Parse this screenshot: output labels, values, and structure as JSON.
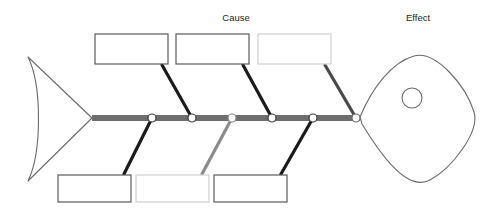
{
  "diagram": {
    "type": "fishbone-ishikawa",
    "title_labels": {
      "cause": "Cause",
      "effect": "Effect"
    },
    "colors": {
      "spine": "#6e6e6e",
      "bone_dark": "#1a1a1a",
      "bone_gray": "#8c8c8c",
      "box_border_dark": "#5a5a5a",
      "box_border_light": "#cfcfcf",
      "outline": "#6a6a6a",
      "joint_fill": "#ffffff",
      "text": "#231f20",
      "background": "#ffffff"
    },
    "spine": {
      "x_start": 92,
      "x_end": 360,
      "y": 118,
      "thickness": 6
    },
    "joints": [
      {
        "id": "joint-1",
        "x": 152,
        "y": 118,
        "r": 4
      },
      {
        "id": "joint-2",
        "x": 192,
        "y": 118,
        "r": 4
      },
      {
        "id": "joint-3",
        "x": 232,
        "y": 118,
        "r": 4
      },
      {
        "id": "joint-4",
        "x": 272,
        "y": 118,
        "r": 4
      },
      {
        "id": "joint-5",
        "x": 313,
        "y": 118,
        "r": 4
      },
      {
        "id": "joint-6",
        "x": 356,
        "y": 118,
        "r": 4
      }
    ],
    "top_boxes": [
      {
        "id": "top-box-1",
        "label": "",
        "x": 95,
        "y": 34,
        "w": 73,
        "h": 30,
        "border": "dark"
      },
      {
        "id": "top-box-2",
        "label": "",
        "x": 176,
        "y": 34,
        "w": 73,
        "h": 30,
        "border": "dark"
      },
      {
        "id": "top-box-3",
        "label": "",
        "x": 258,
        "y": 34,
        "w": 73,
        "h": 30,
        "border": "light"
      }
    ],
    "bottom_boxes": [
      {
        "id": "bottom-box-1",
        "label": "",
        "x": 58,
        "y": 175,
        "w": 73,
        "h": 27,
        "border": "dark"
      },
      {
        "id": "bottom-box-2",
        "label": "",
        "x": 136,
        "y": 175,
        "w": 73,
        "h": 27,
        "border": "light"
      },
      {
        "id": "bottom-box-3",
        "label": "",
        "x": 214,
        "y": 175,
        "w": 73,
        "h": 27,
        "border": "dark"
      }
    ],
    "top_bones": [
      {
        "id": "top-bone-1",
        "x1": 162,
        "y1": 65,
        "x2": 192,
        "y2": 118,
        "color": "dark"
      },
      {
        "id": "top-bone-2",
        "x1": 243,
        "y1": 65,
        "x2": 272,
        "y2": 118,
        "color": "dark"
      },
      {
        "id": "top-bone-3",
        "x1": 325,
        "y1": 65,
        "x2": 356,
        "y2": 118,
        "color": "dark"
      }
    ],
    "bottom_bones": [
      {
        "id": "bottom-bone-1",
        "x1": 124,
        "y1": 174,
        "x2": 152,
        "y2": 118,
        "color": "dark"
      },
      {
        "id": "bottom-bone-2",
        "x1": 202,
        "y1": 174,
        "x2": 232,
        "y2": 118,
        "color": "gray"
      },
      {
        "id": "bottom-bone-3",
        "x1": 281,
        "y1": 174,
        "x2": 313,
        "y2": 118,
        "color": "dark"
      }
    ],
    "tail": {
      "id": "fish-tail",
      "tip_x": 92,
      "tip_y": 118,
      "top_x": 28,
      "top_y": 57,
      "bottom_x": 28,
      "bottom_y": 181
    },
    "head": {
      "id": "fish-head",
      "center_x": 425,
      "center_y": 118,
      "eye_x": 412,
      "eye_y": 98,
      "eye_r": 10
    },
    "label_positions": {
      "cause": {
        "x": 236,
        "y": 21
      },
      "effect": {
        "x": 418,
        "y": 21
      }
    }
  }
}
